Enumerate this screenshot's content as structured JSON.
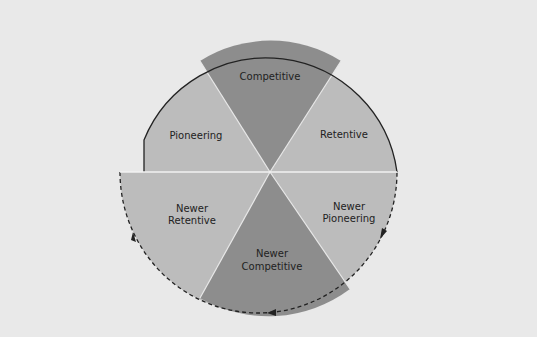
{
  "diagram": {
    "title": "",
    "colors": {
      "background": "#e9e9e9",
      "light_sector": "#bcbcbc",
      "dark_sector": "#8d8d8d",
      "outline": "#222222",
      "divider": "#f2f2f2"
    },
    "upper_half": {
      "style": "solid-outline",
      "sectors": [
        {
          "id": "pioneering",
          "label": "Pioneering",
          "shade": "light"
        },
        {
          "id": "competitive",
          "label": "Competitive",
          "shade": "dark"
        },
        {
          "id": "retentive",
          "label": "Retentive",
          "shade": "light"
        }
      ]
    },
    "lower_half": {
      "style": "dashed-outline",
      "direction_arrows": "counter-clockwise",
      "sectors": [
        {
          "id": "newer-retentive",
          "label_line1": "Newer",
          "label_line2": "Retentive",
          "shade": "light"
        },
        {
          "id": "newer-competitive",
          "label_line1": "Newer",
          "label_line2": "Competitive",
          "shade": "dark"
        },
        {
          "id": "newer-pioneering",
          "label_line1": "Newer",
          "label_line2": "Pioneering",
          "shade": "light"
        }
      ]
    }
  }
}
